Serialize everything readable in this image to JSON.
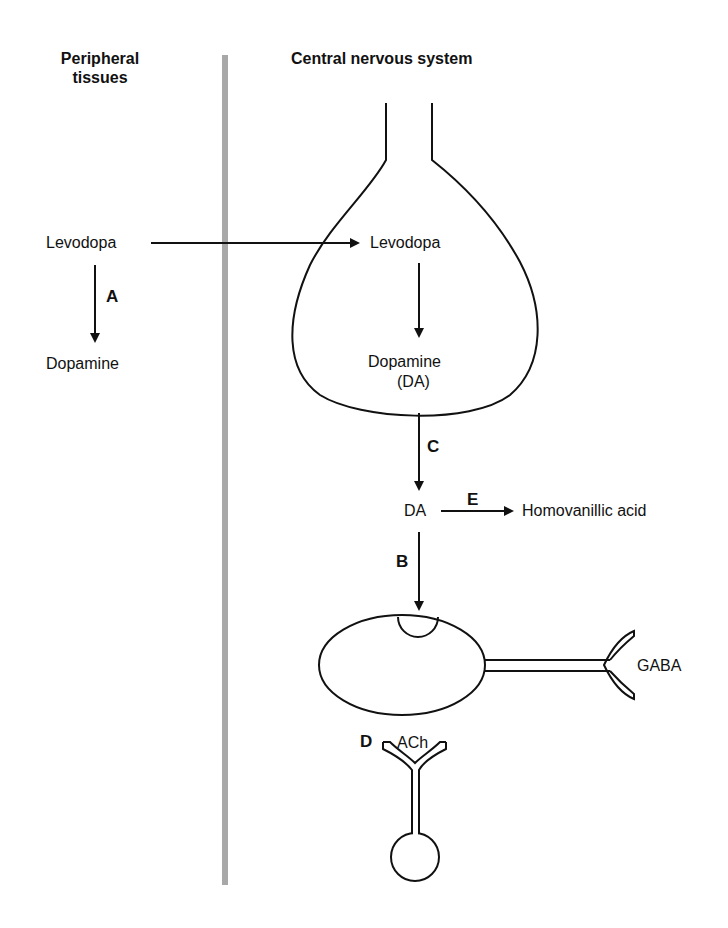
{
  "headers": {
    "peripheral_line1": "Peripheral",
    "peripheral_line2": "tissues",
    "cns": "Central nervous system"
  },
  "peripheral": {
    "levodopa": "Levodopa",
    "dopamine": "Dopamine",
    "step_label": "A"
  },
  "cns": {
    "levodopa": "Levodopa",
    "dopamine": "Dopamine",
    "dopamine_abbrev": "(DA)",
    "da": "DA",
    "metabolite": "Homovanillic acid",
    "gaba": "GABA",
    "ach": "ACh"
  },
  "step_labels": {
    "a": "A",
    "b": "B",
    "c": "C",
    "d": "D",
    "e": "E"
  },
  "colors": {
    "line": "#111111",
    "divider": "#a8a8a8"
  }
}
